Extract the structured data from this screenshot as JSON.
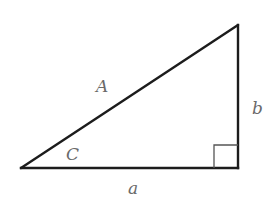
{
  "diagram": {
    "type": "right-triangle",
    "colors": {
      "stroke": "#1c1c1c",
      "right_angle_marker": "#555555",
      "label": "#6a6a6a",
      "background": "#ffffff"
    },
    "vertices": {
      "bottom_left": [
        21,
        168
      ],
      "bottom_right": [
        238,
        168
      ],
      "top_right": [
        238,
        25
      ]
    },
    "right_angle_marker": {
      "x": 214,
      "y": 145,
      "size": 23
    },
    "labels": {
      "hypotenuse": "A",
      "vertical_leg": "b",
      "horizontal_leg": "a",
      "angle": "C"
    }
  }
}
